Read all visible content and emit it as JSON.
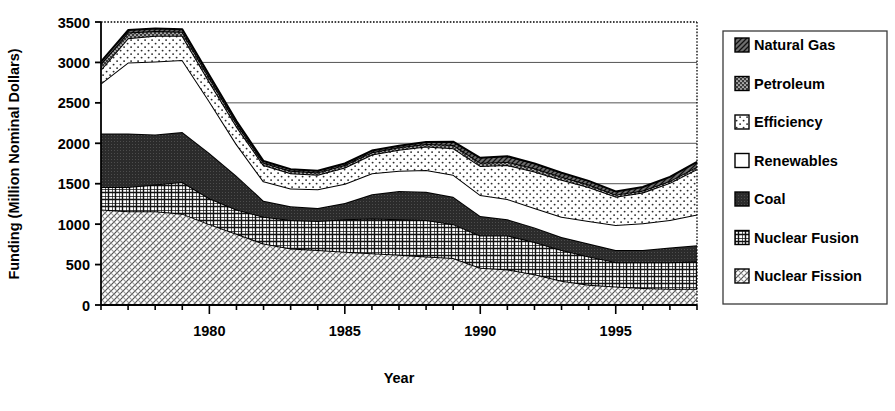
{
  "chart_data": {
    "type": "area",
    "title": "",
    "xlabel": "Year",
    "ylabel": "Funding (Million Nominal Dollars)",
    "ylim": [
      0,
      3500
    ],
    "xlim": [
      1976,
      1998
    ],
    "ytick_labels": [
      "0",
      "500",
      "1000",
      "1500",
      "2000",
      "2500",
      "3000",
      "3500"
    ],
    "ytick_values": [
      0,
      500,
      1000,
      1500,
      2000,
      2500,
      3000,
      3500
    ],
    "xtick_labels": [
      "1980",
      "1985",
      "1990",
      "1995"
    ],
    "xtick_values": [
      1980,
      1985,
      1990,
      1995
    ],
    "grid": "horizontal",
    "legend_position": "right",
    "stacked": true,
    "stack_order_bottom_to_top": [
      "Nuclear Fission",
      "Nuclear Fusion",
      "Coal",
      "Renewables",
      "Efficiency",
      "Petroleum",
      "Natural Gas"
    ],
    "x": [
      1976,
      1977,
      1978,
      1979,
      1980,
      1981,
      1982,
      1983,
      1984,
      1985,
      1986,
      1987,
      1988,
      1989,
      1990,
      1991,
      1992,
      1993,
      1994,
      1995,
      1996,
      1997,
      1998
    ],
    "series": [
      {
        "name": "Nuclear Fission",
        "pattern": "diagonal-hatch-light",
        "values": [
          1180,
          1160,
          1160,
          1130,
          1000,
          880,
          760,
          700,
          680,
          660,
          640,
          620,
          600,
          580,
          460,
          440,
          380,
          300,
          250,
          230,
          210,
          200,
          200
        ]
      },
      {
        "name": "Nuclear Fusion",
        "pattern": "cross-hatch",
        "values": [
          280,
          300,
          330,
          390,
          320,
          300,
          330,
          350,
          360,
          400,
          430,
          440,
          450,
          420,
          400,
          420,
          400,
          380,
          350,
          300,
          320,
          330,
          340
        ]
      },
      {
        "name": "Coal",
        "pattern": "dark-solid",
        "values": [
          660,
          660,
          620,
          620,
          560,
          420,
          200,
          170,
          160,
          200,
          300,
          350,
          350,
          340,
          240,
          200,
          180,
          160,
          160,
          150,
          150,
          180,
          200
        ]
      },
      {
        "name": "Renewables",
        "pattern": "white",
        "values": [
          620,
          880,
          900,
          890,
          640,
          390,
          240,
          220,
          230,
          240,
          260,
          250,
          270,
          270,
          260,
          250,
          240,
          250,
          280,
          310,
          330,
          340,
          380
        ]
      },
      {
        "name": "Efficiency",
        "pattern": "dotted-light",
        "values": [
          170,
          300,
          320,
          300,
          240,
          220,
          200,
          190,
          180,
          200,
          230,
          260,
          290,
          330,
          360,
          420,
          450,
          460,
          420,
          350,
          380,
          460,
          560
        ]
      },
      {
        "name": "Petroleum",
        "pattern": "dark-dotted",
        "values": [
          70,
          70,
          60,
          50,
          50,
          40,
          30,
          30,
          30,
          30,
          30,
          30,
          30,
          40,
          40,
          40,
          40,
          35,
          30,
          25,
          25,
          25,
          30
        ]
      },
      {
        "name": "Natural Gas",
        "pattern": "medium-hatch",
        "values": [
          30,
          30,
          30,
          30,
          30,
          25,
          20,
          20,
          20,
          20,
          20,
          20,
          25,
          40,
          60,
          70,
          60,
          50,
          45,
          40,
          45,
          50,
          60
        ]
      }
    ],
    "legend_entries": [
      {
        "label": "Natural Gas",
        "pattern": "medium-hatch"
      },
      {
        "label": "Petroleum",
        "pattern": "dark-dotted"
      },
      {
        "label": "Efficiency",
        "pattern": "dotted-light"
      },
      {
        "label": "Renewables",
        "pattern": "white"
      },
      {
        "label": "Coal",
        "pattern": "dark-solid"
      },
      {
        "label": "Nuclear Fusion",
        "pattern": "cross-hatch"
      },
      {
        "label": "Nuclear Fission",
        "pattern": "diagonal-hatch-light"
      }
    ]
  }
}
